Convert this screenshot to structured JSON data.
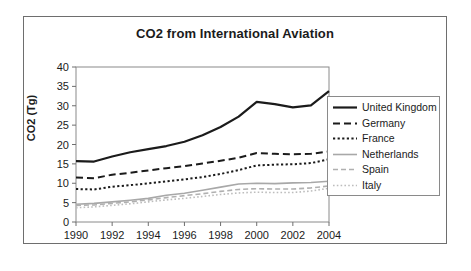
{
  "figure": {
    "title": "CO2 from International Aviation",
    "y_axis_title": "CO2 (Tg)"
  },
  "chart_data": {
    "type": "line",
    "title": "CO2 from International Aviation",
    "xlabel": "",
    "ylabel": "CO2 (Tg)",
    "xlim": [
      1990,
      2004
    ],
    "ylim": [
      0,
      40
    ],
    "ytick_values": [
      0,
      5,
      10,
      15,
      20,
      25,
      30,
      35,
      40
    ],
    "ytick_labels": [
      "0",
      "5",
      "10",
      "15",
      "20",
      "25",
      "30",
      "35",
      "40"
    ],
    "xtick_values": [
      1990,
      1992,
      1994,
      1996,
      1998,
      2000,
      2002,
      2004
    ],
    "xtick_labels": [
      "1990",
      "1992",
      "1994",
      "1996",
      "1998",
      "2000",
      "2002",
      "2004"
    ],
    "grid": false,
    "legend_position": "right",
    "x": [
      1990,
      1991,
      1992,
      1993,
      1994,
      1995,
      1996,
      1997,
      1998,
      1999,
      2000,
      2001,
      2002,
      2003,
      2004
    ],
    "series": [
      {
        "name": "United Kingdom",
        "color": "#1b1b1b",
        "style": "solid",
        "width": 2.2,
        "values": [
          15.7,
          15.6,
          16.9,
          18.0,
          18.8,
          19.6,
          20.7,
          22.4,
          24.5,
          27.2,
          31.0,
          30.4,
          29.6,
          30.1,
          33.8
        ]
      },
      {
        "name": "Germany",
        "color": "#1b1b1b",
        "style": "dashed",
        "width": 2.0,
        "values": [
          11.5,
          11.3,
          12.2,
          12.7,
          13.3,
          13.9,
          14.4,
          15.1,
          15.8,
          16.6,
          17.8,
          17.6,
          17.5,
          17.6,
          18.2
        ]
      },
      {
        "name": "France",
        "color": "#1b1b1b",
        "style": "dotted",
        "width": 2.0,
        "values": [
          8.5,
          8.4,
          9.1,
          9.5,
          10.0,
          10.5,
          11.0,
          11.6,
          12.4,
          13.4,
          14.6,
          14.8,
          14.9,
          15.2,
          16.2
        ]
      },
      {
        "name": "Netherlands",
        "color": "#a8a8a8",
        "style": "solid",
        "width": 1.6,
        "values": [
          4.6,
          4.8,
          5.2,
          5.6,
          6.1,
          6.9,
          7.4,
          8.2,
          9.0,
          9.8,
          10.0,
          9.9,
          10.1,
          10.2,
          10.5
        ]
      },
      {
        "name": "Spain",
        "color": "#b0b0b0",
        "style": "dashed",
        "width": 1.6,
        "values": [
          4.3,
          4.4,
          4.8,
          5.2,
          5.7,
          6.3,
          6.8,
          7.3,
          7.9,
          8.4,
          8.6,
          8.5,
          8.5,
          8.8,
          9.3
        ]
      },
      {
        "name": "Italy",
        "color": "#bdbdbd",
        "style": "dotted",
        "width": 1.6,
        "values": [
          3.7,
          3.9,
          4.3,
          4.7,
          5.2,
          5.7,
          6.1,
          6.6,
          7.1,
          7.5,
          7.7,
          7.6,
          7.6,
          8.0,
          8.7
        ]
      }
    ]
  },
  "legend": {
    "items": [
      {
        "label": "United Kingdom"
      },
      {
        "label": "Germany"
      },
      {
        "label": "France"
      },
      {
        "label": "Netherlands"
      },
      {
        "label": "Spain"
      },
      {
        "label": "Italy"
      }
    ]
  }
}
